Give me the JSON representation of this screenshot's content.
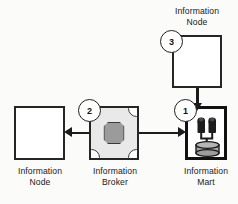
{
  "diagram": {
    "colors": {
      "stroke": "#1b1b1b",
      "mart_border": "#111111",
      "broker_fill": "#e9e9e9",
      "broker_center": "#9b9b9b",
      "background": "#fbfbfa"
    },
    "nodes": [
      {
        "id": "information-node-top",
        "type": "node",
        "label": "Information\nNode",
        "label_position": "above"
      },
      {
        "id": "information-node-left",
        "type": "node",
        "label": "Information\nNode",
        "label_position": "below"
      },
      {
        "id": "information-broker",
        "type": "broker",
        "label": "Information\nBroker",
        "label_position": "below",
        "icon": "broker-puzzle-icon"
      },
      {
        "id": "information-mart",
        "type": "mart",
        "label": "Information\nMart",
        "label_position": "below",
        "icon": "mart-database-icon"
      }
    ],
    "steps": [
      {
        "number": "1",
        "from": "information-broker",
        "to": "information-mart"
      },
      {
        "number": "2",
        "from": "information-broker",
        "to": "information-node-left"
      },
      {
        "number": "3",
        "from": "information-node-top",
        "to": "information-mart"
      }
    ],
    "arrows": [
      {
        "id": "arrow-broker-to-node",
        "direction": "left"
      },
      {
        "id": "arrow-broker-to-mart",
        "direction": "right"
      },
      {
        "id": "arrow-node-to-mart",
        "direction": "down"
      }
    ]
  }
}
